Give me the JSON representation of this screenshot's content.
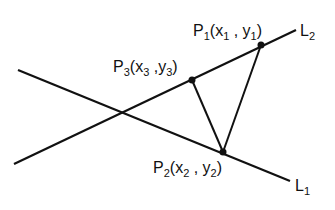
{
  "diagram": {
    "lines": [
      {
        "name": "L1",
        "label": "L",
        "sub": "1",
        "x1": 18,
        "y1": 70,
        "x2": 290,
        "y2": 181
      },
      {
        "name": "L2",
        "label": "L",
        "sub": "2",
        "x1": 14,
        "y1": 164,
        "x2": 296,
        "y2": 30
      }
    ],
    "points": [
      {
        "name": "P1",
        "label": "P",
        "sub": "1",
        "coords": "(x1, y1)",
        "x": 261,
        "y": 45
      },
      {
        "name": "P2",
        "label": "P",
        "sub": "2",
        "coords": "(x2, y2)",
        "x": 223,
        "y": 152
      },
      {
        "name": "P3",
        "label": "P",
        "sub": "3",
        "coords": "(x3, y3)",
        "x": 192,
        "y": 80
      }
    ],
    "labels": {
      "p1": {
        "main": "P",
        "sub": "1",
        "open": "(x",
        "xsub": "1",
        "mid": " , y",
        "ysub": "1",
        "close": ")"
      },
      "p2": {
        "main": "P",
        "sub": "2",
        "open": "(x",
        "xsub": "2",
        "mid": " , y",
        "ysub": "2",
        "close": ")"
      },
      "p3": {
        "main": "P",
        "sub": "3",
        "open": "(x",
        "xsub": "3",
        "mid": " ,y",
        "ysub": "3",
        "close": ")"
      },
      "l1": {
        "main": "L",
        "sub": "1"
      },
      "l2": {
        "main": "L",
        "sub": "2"
      }
    }
  }
}
